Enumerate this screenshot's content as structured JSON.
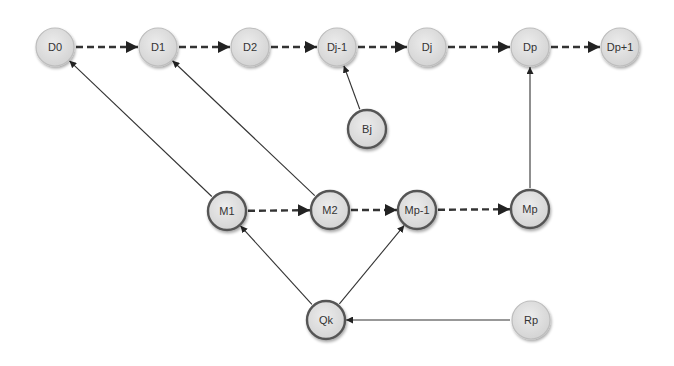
{
  "diagram": {
    "nodes": [
      {
        "id": "D0",
        "label": "D0",
        "x": 55,
        "y": 47,
        "style": "light"
      },
      {
        "id": "D1",
        "label": "D1",
        "x": 158,
        "y": 47,
        "style": "light"
      },
      {
        "id": "D2",
        "label": "D2",
        "x": 250,
        "y": 47,
        "style": "light"
      },
      {
        "id": "Dj-1",
        "label": "Dj-1",
        "x": 337,
        "y": 47,
        "style": "light"
      },
      {
        "id": "Dj",
        "label": "Dj",
        "x": 427,
        "y": 47,
        "style": "light"
      },
      {
        "id": "Dp",
        "label": "Dp",
        "x": 530,
        "y": 47,
        "style": "light"
      },
      {
        "id": "Dp+1",
        "label": "Dp+1",
        "x": 620,
        "y": 47,
        "style": "light"
      },
      {
        "id": "Bj",
        "label": "Bj",
        "x": 367,
        "y": 129,
        "style": "dark"
      },
      {
        "id": "M1",
        "label": "M1",
        "x": 227,
        "y": 211,
        "style": "dark"
      },
      {
        "id": "M2",
        "label": "M2",
        "x": 330,
        "y": 210,
        "style": "dark"
      },
      {
        "id": "Mp-1",
        "label": "Mp-1",
        "x": 417,
        "y": 210,
        "style": "dark"
      },
      {
        "id": "Mp",
        "label": "Mp",
        "x": 530,
        "y": 209,
        "style": "dark"
      },
      {
        "id": "Qk",
        "label": "Qk",
        "x": 326,
        "y": 320,
        "style": "dark"
      },
      {
        "id": "Rp",
        "label": "Rp",
        "x": 531,
        "y": 320,
        "style": "light"
      }
    ],
    "edges": [
      {
        "from": "D0",
        "to": "D1",
        "type": "dashed"
      },
      {
        "from": "D1",
        "to": "D2",
        "type": "dashed"
      },
      {
        "from": "D2",
        "to": "Dj-1",
        "type": "dashed"
      },
      {
        "from": "Dj-1",
        "to": "Dj",
        "type": "dashed"
      },
      {
        "from": "Dj",
        "to": "Dp",
        "type": "dashed"
      },
      {
        "from": "Dp",
        "to": "Dp+1",
        "type": "dashed"
      },
      {
        "from": "M1",
        "to": "M2",
        "type": "dashed"
      },
      {
        "from": "M2",
        "to": "Mp-1",
        "type": "dashed"
      },
      {
        "from": "Mp-1",
        "to": "Mp",
        "type": "dashed"
      },
      {
        "from": "Bj",
        "to": "Dj-1",
        "type": "solid"
      },
      {
        "from": "M1",
        "to": "D0",
        "type": "solid"
      },
      {
        "from": "M2",
        "to": "D1",
        "type": "solid"
      },
      {
        "from": "Mp",
        "to": "Dp",
        "type": "solid"
      },
      {
        "from": "Qk",
        "to": "M1",
        "type": "solid"
      },
      {
        "from": "Qk",
        "to": "Mp-1",
        "type": "solid"
      },
      {
        "from": "Rp",
        "to": "Qk",
        "type": "solid"
      }
    ],
    "colors": {
      "node_fill": "#dcdcdc",
      "light_stroke": "#bdbdbd",
      "dark_stroke": "#555555",
      "edge": "#333333",
      "label": "#333333"
    }
  }
}
